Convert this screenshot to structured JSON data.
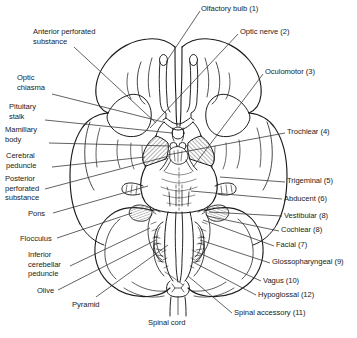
{
  "figure": {
    "style": {
      "background": "#ffffff",
      "ink": "#1b1b1b",
      "leader_line": "#3a3a3a",
      "hatch": "#444444"
    }
  },
  "labels_left": [
    {
      "id": "anterior-perforated-substance",
      "text": "Anterior perforated\nsubstance",
      "x": 33,
      "y": 27
    },
    {
      "id": "optic-chiasma",
      "text": "Optic\nchiasma",
      "x": 17,
      "y": 73
    },
    {
      "id": "pituitary-stalk",
      "text": "Pituitary\nstalk",
      "x": 9,
      "y": 102
    },
    {
      "id": "mamillary-body",
      "text": "Mamillary\nbody",
      "x": 5,
      "y": 125
    },
    {
      "id": "cerebral-peduncle",
      "text": "Cerebral\npeduncle",
      "x": 6,
      "y": 149
    },
    {
      "id": "posterior-perforated-substance",
      "text": "Posterior\nperforated\nsubstance",
      "x": 5,
      "y": 172
    },
    {
      "id": "pons",
      "text": "Pons",
      "x": 28,
      "y": 210
    },
    {
      "id": "flocculus",
      "text": "Flocculus",
      "x": 20,
      "y": 234
    },
    {
      "id": "inferior-cerebellar-peduncle",
      "text": "Inferior\ncerebellar\npeduncle",
      "x": 28,
      "y": 249
    },
    {
      "id": "olive",
      "text": "Olive",
      "x": 37,
      "y": 286
    },
    {
      "id": "pyramid",
      "text": "Pyramid",
      "x": 72,
      "y": 300
    }
  ],
  "labels_right": [
    {
      "id": "olfactory-bulb",
      "text": "Olfactory bulb (1)",
      "x": 201,
      "y": 4
    },
    {
      "id": "optic-nerve",
      "text": "Optic nerve (2)",
      "x": 240,
      "y": 27
    },
    {
      "id": "oculomotor",
      "text": "Oculomotor (3)",
      "x": 265,
      "y": 67
    },
    {
      "id": "trochlear",
      "text": "Trochlear (4)",
      "x": 287,
      "y": 127
    },
    {
      "id": "trigeminal",
      "text": "Trigeminal (5)",
      "x": 287,
      "y": 176
    },
    {
      "id": "abducent",
      "text": "Abducent (6)",
      "x": 284,
      "y": 194
    },
    {
      "id": "vestibular",
      "text": "Vestibular (8)",
      "x": 284,
      "y": 211
    },
    {
      "id": "cochlear",
      "text": "Cochlear (8)",
      "x": 281,
      "y": 225
    },
    {
      "id": "facial",
      "text": "Facial (7)",
      "x": 276,
      "y": 240
    },
    {
      "id": "glossopharyngeal",
      "text": "Glossopharyngeal (9)",
      "x": 272,
      "y": 257
    },
    {
      "id": "vagus",
      "text": "Vagus (10)",
      "x": 263,
      "y": 276
    },
    {
      "id": "hypoglossal",
      "text": "Hypoglossal (12)",
      "x": 258,
      "y": 290
    },
    {
      "id": "spinal-accessory",
      "text": "Spinal accessory (11)",
      "x": 234,
      "y": 308
    }
  ],
  "labels_bottom": [
    {
      "id": "spinal-cord",
      "text": "Spinal cord",
      "x": 148,
      "y": 319
    }
  ]
}
